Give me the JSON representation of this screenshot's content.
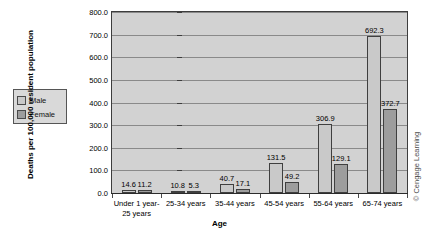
{
  "chart_data": {
    "type": "bar",
    "title": "",
    "subtitle": "",
    "xlabel": "Age",
    "ylabel": "Deaths per 100,000 resident population",
    "categories": [
      "Under 1 year-\n25 years",
      "25-34 years",
      "35-44 years",
      "45-54 years",
      "55-64 years",
      "65-74 years"
    ],
    "category_lines": [
      [
        "Under 1 year-",
        "25 years"
      ],
      [
        "25-34 years"
      ],
      [
        "35-44 years"
      ],
      [
        "45-54 years"
      ],
      [
        "55-64 years"
      ],
      [
        "65-74 years"
      ]
    ],
    "series": [
      {
        "name": "Male",
        "color": "#c9c9c9",
        "values": [
          14.6,
          10.8,
          40.7,
          131.5,
          306.9,
          692.3
        ]
      },
      {
        "name": "Female",
        "color": "#9d9d9d",
        "values": [
          11.2,
          5.3,
          17.1,
          49.2,
          129.1,
          372.7
        ]
      }
    ],
    "ylim": [
      0,
      800
    ],
    "ytick_labels": [
      "800.0",
      "700.0",
      "600.0",
      "500.0",
      "400.0",
      "300.0",
      "200.0",
      "100.0",
      "0.0"
    ],
    "ytick_values": [
      800,
      700,
      600,
      500,
      400,
      300,
      200,
      100,
      0
    ],
    "grid": true,
    "legend_position": "left-outside",
    "data_labels": true,
    "plot_background": "#d2d2d2"
  },
  "legend": {
    "items": [
      {
        "label": "Male"
      },
      {
        "label": "Female"
      }
    ]
  },
  "credit": {
    "text": "© Cengage Learning"
  }
}
